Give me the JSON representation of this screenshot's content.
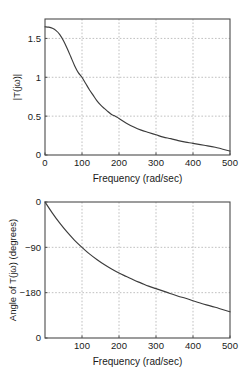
{
  "page": {
    "background": "#ffffff",
    "ink": "#1a1a1a",
    "curve_color": "#3c3c3c",
    "grid_color": "#b0b0b0",
    "axis_color": "#4c4c4c"
  },
  "chart_data": [
    {
      "id": "magnitude",
      "type": "line",
      "title": "",
      "xlabel": "Frequency (rad/sec)",
      "ylabel": "|T(jω)|",
      "xlim": [
        0,
        500
      ],
      "ylim": [
        0,
        1.75
      ],
      "grid": true,
      "legend": null,
      "xticks": [
        0,
        100,
        200,
        300,
        400,
        500
      ],
      "xticklabels": [
        "0",
        "100",
        "200",
        "300",
        "400",
        "500"
      ],
      "yticks": [
        0,
        0.5,
        1,
        1.5
      ],
      "yticklabels": [
        "0",
        "0.5",
        "1",
        "1.5"
      ],
      "x": [
        0,
        10,
        20,
        30,
        40,
        50,
        60,
        70,
        80,
        90,
        100,
        110,
        120,
        130,
        140,
        150,
        160,
        170,
        180,
        190,
        200,
        220,
        240,
        260,
        280,
        300,
        320,
        340,
        360,
        380,
        400,
        430,
        460,
        500
      ],
      "y": [
        1.65,
        1.645,
        1.63,
        1.6,
        1.55,
        1.47,
        1.37,
        1.26,
        1.15,
        1.06,
        1.0,
        0.92,
        0.84,
        0.77,
        0.7,
        0.645,
        0.6,
        0.56,
        0.52,
        0.5,
        0.47,
        0.41,
        0.36,
        0.32,
        0.29,
        0.26,
        0.23,
        0.21,
        0.185,
        0.165,
        0.15,
        0.125,
        0.1,
        0.05
      ]
    },
    {
      "id": "phase",
      "type": "line",
      "title": "",
      "xlabel": "Frequency (rad/sec)",
      "ylabel": "Angle of T(jω) (degrees)",
      "xlim": [
        0,
        500
      ],
      "ylim": [
        -270,
        0
      ],
      "grid": true,
      "legend": null,
      "xticks": [
        100,
        200,
        300,
        400,
        500
      ],
      "xticklabels": [
        "100",
        "200",
        "300",
        "400",
        "500"
      ],
      "yticks": [
        0,
        -90,
        -180,
        -270
      ],
      "yticklabels": [
        "0",
        "−90",
        "−180",
        "0"
      ],
      "x": [
        0,
        20,
        40,
        60,
        80,
        100,
        120,
        140,
        160,
        180,
        200,
        220,
        240,
        260,
        280,
        300,
        320,
        340,
        360,
        380,
        400,
        430,
        460,
        500
      ],
      "y": [
        0,
        -22,
        -42,
        -60,
        -76,
        -90,
        -103,
        -114,
        -124,
        -133,
        -141,
        -148,
        -155,
        -161,
        -167,
        -172,
        -177,
        -182,
        -187,
        -191,
        -196,
        -203,
        -209,
        -218
      ]
    }
  ]
}
